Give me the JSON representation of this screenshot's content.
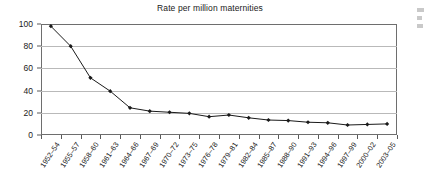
{
  "chart_data": {
    "type": "line",
    "title": "Rate per million maternities",
    "xlabel": "",
    "ylabel": "",
    "ylim": [
      0,
      100
    ],
    "yticks": [
      0,
      20,
      40,
      60,
      80,
      100
    ],
    "grid": "horizontal",
    "legend": "none",
    "marker": "filled-diamond",
    "line_color": "#1a1a1a",
    "gridline_color": "#b9b9b9",
    "frame_color": "#6e6e6e",
    "categories": [
      "1952–54",
      "1955–57",
      "1958–60",
      "1961–63",
      "1964–66",
      "1967–69",
      "1970–72",
      "1973–75",
      "1976–78",
      "1979–81",
      "1982–84",
      "1985–87",
      "1988–90",
      "1991–93",
      "1994–96",
      "1997–99",
      "2000–02",
      "2003–05"
    ],
    "values": [
      98,
      80,
      51.5,
      39.5,
      24.5,
      21.5,
      20.5,
      19.5,
      16.5,
      18,
      15.5,
      13.5,
      13,
      11.5,
      11,
      9,
      9.5,
      10
    ]
  }
}
